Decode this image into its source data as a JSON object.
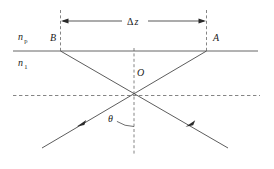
{
  "figure": {
    "canvas": {
      "width": 274,
      "height": 169,
      "background": "#ffffff"
    },
    "colors": {
      "solid_line": "#555555",
      "ray_line": "#4a4a4a",
      "dashed_line": "#777777",
      "arrowhead": "#2b2b2b",
      "text": "#1a1a1a"
    }
  },
  "labels": {
    "medium_upper": {
      "base": "n",
      "sub": "p",
      "full": "n_p",
      "x": 18,
      "y": 40
    },
    "medium_lower": {
      "base": "n",
      "sub": "1",
      "full": "n_1",
      "x": 18,
      "y": 66
    },
    "point_b": {
      "text": "B",
      "x": 50,
      "y": 41
    },
    "point_a": {
      "text": "A",
      "x": 213,
      "y": 41
    },
    "point_o": {
      "text": "O",
      "x": 137,
      "y": 76
    },
    "angle_theta": {
      "text": "θ",
      "x": 108,
      "y": 122
    },
    "separation": {
      "base": "Δ",
      "var": "z",
      "full": "Δz",
      "x": 127,
      "y": 25
    }
  },
  "geometry": {
    "interface_line": {
      "x1": 13,
      "y1": 51,
      "x2": 258,
      "y2": 51
    },
    "normal_dashed_horizontal": {
      "x1": 13,
      "y1": 95.5,
      "x2": 260,
      "y2": 95.5
    },
    "center_dashed_vertical": {
      "x": 134,
      "y1": 48,
      "y2": 155
    },
    "left_dashed_vertical": {
      "x": 60.5,
      "y1": 10,
      "y2": 52
    },
    "right_dashed_vertical": {
      "x": 206.5,
      "y1": 10,
      "y2": 52
    },
    "dimension_arrow": {
      "y": 21,
      "x_left": 61,
      "x_right": 206
    },
    "ray_b_to_bottom_right": {
      "x1": 60.5,
      "y1": 51,
      "x2": 228,
      "y2": 148
    },
    "ray_a_to_bottom_left": {
      "x1": 206.5,
      "y1": 51,
      "x2": 42,
      "y2": 148
    },
    "crossing_point": {
      "x": 134,
      "y": 95.5
    },
    "arrowhead_left_ray": {
      "x": 80,
      "y": 124
    },
    "arrowhead_right_ray": {
      "x": 189,
      "y": 124
    },
    "theta_arc": {
      "cx": 134,
      "cy": 95.5,
      "radius": 31
    }
  }
}
